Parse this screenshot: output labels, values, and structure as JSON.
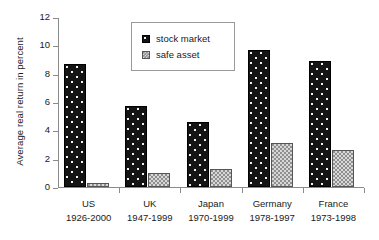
{
  "chart_data": {
    "type": "bar",
    "title": "",
    "xlabel": "",
    "ylabel": "Average real return in percent",
    "ylim": [
      0,
      12
    ],
    "yticks": [
      0,
      2,
      4,
      6,
      8,
      10,
      12
    ],
    "grid": false,
    "legend_position": "upper-center",
    "categories": [
      "US",
      "UK",
      "Japan",
      "Germany",
      "France"
    ],
    "category_periods": [
      "1926-2000",
      "1947-1999",
      "1970-1999",
      "1978-1997",
      "1973-1998"
    ],
    "series": [
      {
        "name": "stock market",
        "values": [
          8.7,
          5.7,
          4.6,
          9.7,
          8.9
        ],
        "color": "#141414"
      },
      {
        "name": "safe asset",
        "values": [
          0.3,
          1.0,
          1.3,
          3.1,
          2.6
        ],
        "color": "#8f8f8f"
      }
    ]
  },
  "legend": {
    "items": [
      {
        "label": "stock market"
      },
      {
        "label": "safe asset"
      }
    ]
  }
}
